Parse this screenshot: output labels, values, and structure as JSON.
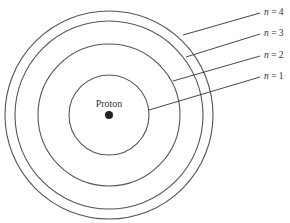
{
  "diagram": {
    "nucleus": {
      "label": "Proton",
      "cx": 109,
      "cy": 115,
      "r": 4
    },
    "orbits": [
      {
        "n": 1,
        "r": 40,
        "label_var": "n",
        "label_rest": " = 1",
        "line": [
          149,
          110,
          260,
          77
        ],
        "label_y": 79
      },
      {
        "n": 2,
        "r": 71,
        "label_var": "n",
        "label_rest": " = 2",
        "line": [
          173,
          81,
          260,
          56
        ],
        "label_y": 58
      },
      {
        "n": 3,
        "r": 94,
        "label_var": "n",
        "label_rest": " = 3",
        "line": [
          186,
          57,
          260,
          34
        ],
        "label_y": 36
      },
      {
        "n": 4,
        "r": 104,
        "label_var": "n",
        "label_rest": " = 4",
        "line": [
          183,
          35,
          260,
          13
        ],
        "label_y": 15
      }
    ],
    "colors": {
      "stroke": "#555555",
      "text": "#333333",
      "nucleus": "#222222",
      "background": "#ffffff"
    }
  }
}
